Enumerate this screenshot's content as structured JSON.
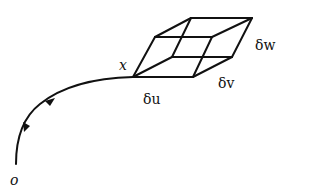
{
  "figure": {
    "type": "geometric diagram",
    "labels": {
      "origin": "o",
      "point": "x",
      "du": "δu",
      "dv": "δv",
      "dw": "δw"
    },
    "colors": {
      "stroke": "#111111",
      "background": "#ffffff"
    },
    "curve": {
      "start": [
        16,
        164
      ],
      "end": [
        133,
        77
      ],
      "arrows": [
        {
          "position": [
            50,
            102
          ],
          "direction": "toward-x"
        },
        {
          "position": [
            26,
            128
          ],
          "direction": "toward-o"
        }
      ]
    },
    "parallelepiped": {
      "vertices": {
        "x": [
          133,
          77
        ],
        "u": [
          193,
          77
        ],
        "v": [
          172,
          57
        ],
        "uv": [
          232,
          57
        ],
        "w": [
          155,
          37
        ],
        "uw": [
          212,
          37
        ],
        "vw": [
          191,
          18
        ],
        "uvw": [
          252,
          18
        ]
      }
    }
  }
}
